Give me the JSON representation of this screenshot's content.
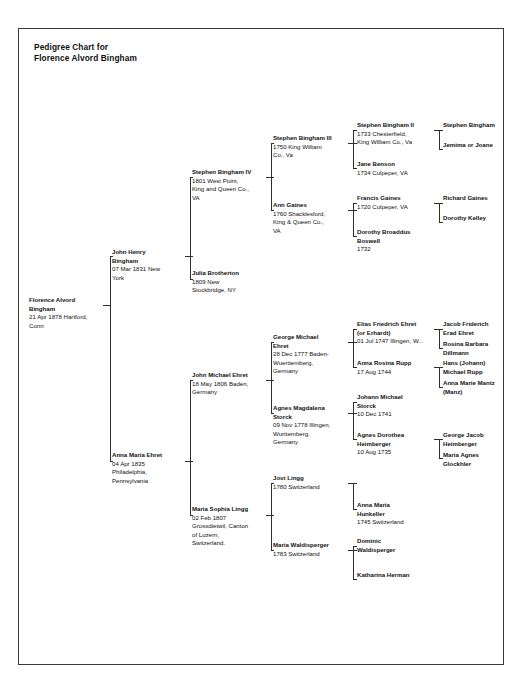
{
  "document": {
    "title": "Pedigree Chart for\nFlorence Alvord Bingham",
    "type": "pedigree-chart"
  },
  "people": {
    "p1": {
      "name": "Florence Alvord\nBingham",
      "detail": "21 Apr 1878 Hartford,\nConn"
    },
    "p2": {
      "name": "John Henry\nBingham",
      "detail": "07 Mar 1831 New\nYork"
    },
    "p3": {
      "name": "Anna Maria Ehret",
      "detail": "04 Apr 1835\nPhiladelphia,\nPennsylvania"
    },
    "p4": {
      "name": "Stephen Bingham IV",
      "detail": "1801 West Point,\nKing and Queen Co.,\nVA"
    },
    "p5": {
      "name": "Julia Brotherton",
      "detail": "1809 New\nStockbridge, NY"
    },
    "p6": {
      "name": "John Michael Ehret",
      "detail": "18 May 1806 Baden,\nGermany"
    },
    "p7": {
      "name": "Maria Sophia Lingg",
      "detail": "02 Feb 1807\nGrossdietwil, Canton\nof Luzern,\nSwitzerland."
    },
    "p8": {
      "name": "Stephen Bingham III",
      "detail": "1750 King William\nCo., Va"
    },
    "p9": {
      "name": "Ann Gaines",
      "detail": "1760 Shacklesford,\nKing & Queen Co.,\nVA"
    },
    "p12": {
      "name": "George Michael\nEhret",
      "detail": "28 Dec 1777 Baden-\nWuerttemberg,\nGermany"
    },
    "p13": {
      "name": "Agnes Magdalena\nStorck",
      "detail": "09 Nov 1778 Illingen,\nWurttemberg,\nGermany"
    },
    "p14": {
      "name": "Jost Lingg",
      "detail": "1780 Switzerland"
    },
    "p15": {
      "name": "Maria Waldisperger",
      "detail": "1783 Switzerland"
    },
    "p16": {
      "name": "Stephen Bingham II",
      "detail": "1733 Chesterfield,\nKing William Co., Va"
    },
    "p17": {
      "name": "Jane Benson",
      "detail": "1734 Culpeper, VA"
    },
    "p18": {
      "name": "Francis Gaines",
      "detail": "1720 Culpeper, VA"
    },
    "p19": {
      "name": "Dorothy Broaddus\nBoswell",
      "detail": "1732"
    },
    "p24": {
      "name": "Elias Friedrich Ehret\n(or Erhardt)",
      "detail": "01 Jul 1747 Illingen, W..."
    },
    "p25": {
      "name": "Anna Rosina Rupp",
      "detail": "17 Aug 1744"
    },
    "p26": {
      "name": "Johann Michael\nStorck",
      "detail": "10 Dec 1741"
    },
    "p27": {
      "name": "Agnes Dorothea\nHeimberger",
      "detail": "10 Aug 1735"
    },
    "p28": {
      "name": "Anna Maria\nHunkeller",
      "detail": "1745 Switzerland"
    },
    "p29": {
      "name": "Dominic\nWaldisperger",
      "detail": ""
    },
    "p30": {
      "name": "Katharina Herman",
      "detail": ""
    },
    "p32": {
      "name": "Stephen Bingham",
      "detail": ""
    },
    "p33": {
      "name": "Jemima or Joane",
      "detail": ""
    },
    "p36": {
      "name": "Richard Gaines",
      "detail": ""
    },
    "p37": {
      "name": "Dorothy Kelley",
      "detail": ""
    },
    "p48": {
      "name": "Jacob Friderich\nErad Ehret",
      "detail": ""
    },
    "p49": {
      "name": "Rosina Barbara\nDillmann",
      "detail": ""
    },
    "p50": {
      "name": "Hans (Johann)\nMichael Rupp",
      "detail": ""
    },
    "p51": {
      "name": "Anna Marie Mantz\n(Manz)",
      "detail": ""
    },
    "p52": {
      "name": "George Jacob\nHeimberger",
      "detail": ""
    },
    "p53": {
      "name": "Maria Agnes\nGlockhler",
      "detail": ""
    }
  }
}
